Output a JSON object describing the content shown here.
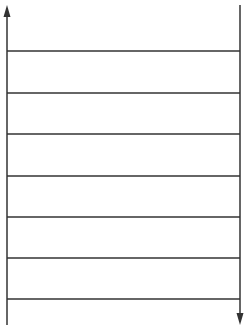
{
  "diagram": {
    "type": "ladder",
    "stroke_color": "#333333",
    "left_rail": {
      "x": 7,
      "y_top": 5,
      "y_bottom": 325,
      "arrow": "up"
    },
    "right_rail": {
      "x": 240,
      "y_top": 5,
      "y_bottom": 325,
      "arrow": "down"
    },
    "rungs": [
      {
        "y": 51
      },
      {
        "y": 93
      },
      {
        "y": 134
      },
      {
        "y": 176
      },
      {
        "y": 217
      },
      {
        "y": 258
      },
      {
        "y": 299
      }
    ]
  }
}
